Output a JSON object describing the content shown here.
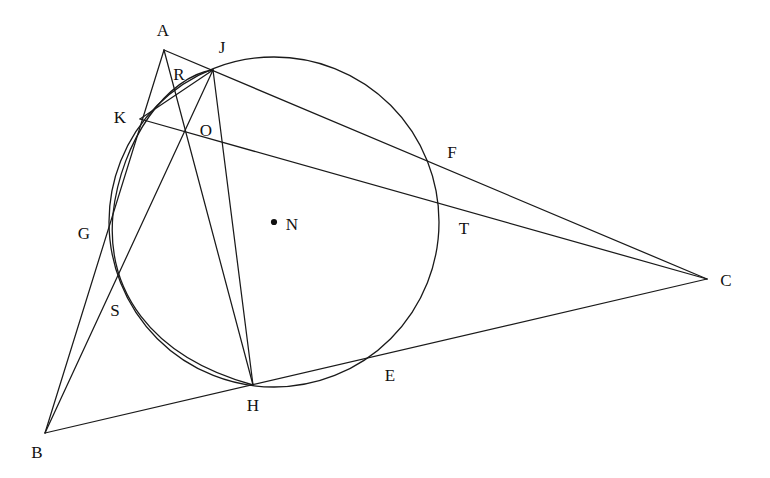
{
  "figure": {
    "type": "euclidean-geometry-diagram",
    "canvas": {
      "width": 770,
      "height": 478
    },
    "stroke_color": "#1a1a1a",
    "background_color": "#ffffff",
    "label_color": "#111111"
  },
  "points": [
    {
      "id": "A",
      "label": "A",
      "x": 164,
      "y": 50,
      "label_x": 163,
      "label_y": 30,
      "marked": false
    },
    {
      "id": "J",
      "label": "J",
      "x": 213,
      "y": 70,
      "label_x": 222,
      "label_y": 47,
      "marked": false
    },
    {
      "id": "R",
      "label": "R",
      "x": 184,
      "y": 92,
      "label_x": 179,
      "label_y": 74,
      "marked": false
    },
    {
      "id": "K",
      "label": "K",
      "x": 140,
      "y": 119,
      "label_x": 120,
      "label_y": 117,
      "marked": false
    },
    {
      "id": "O",
      "label": "O",
      "x": 185,
      "y": 133,
      "label_x": 206,
      "label_y": 130,
      "marked": false
    },
    {
      "id": "F",
      "label": "F",
      "x": 440,
      "y": 152,
      "label_x": 452,
      "label_y": 152,
      "marked": false
    },
    {
      "id": "N",
      "label": "N",
      "x": 274,
      "y": 222,
      "label_x": 292,
      "label_y": 224,
      "marked": true
    },
    {
      "id": "T",
      "label": "T",
      "x": 442,
      "y": 214,
      "label_x": 464,
      "label_y": 228,
      "marked": false
    },
    {
      "id": "G",
      "label": "G",
      "x": 103,
      "y": 235,
      "label_x": 84,
      "label_y": 233,
      "marked": false
    },
    {
      "id": "C",
      "label": "C",
      "x": 707,
      "y": 279,
      "label_x": 726,
      "label_y": 280,
      "marked": false
    },
    {
      "id": "S",
      "label": "S",
      "x": 115,
      "y": 282,
      "label_x": 115,
      "label_y": 310,
      "marked": false
    },
    {
      "id": "E",
      "label": "E",
      "x": 378,
      "y": 356,
      "label_x": 390,
      "label_y": 375,
      "marked": false
    },
    {
      "id": "H",
      "label": "H",
      "x": 253,
      "y": 385,
      "label_x": 253,
      "label_y": 405,
      "marked": false
    },
    {
      "id": "B",
      "label": "B",
      "x": 45,
      "y": 433,
      "label_x": 37,
      "label_y": 452,
      "marked": false
    }
  ],
  "circles": [
    {
      "id": "circumcircle-N",
      "name": "main-circle-centre-N",
      "cx": 274,
      "cy": 222,
      "r": 165
    }
  ],
  "arcs": [
    {
      "id": "arc-J-K-H",
      "name": "secondary-arc-through-J-K-S-H",
      "path": "M 213 70 C 168 76 121 140 113 214 C 106 288 148 356 253 385"
    }
  ],
  "segments": [
    {
      "id": "seg-A-B",
      "name": "side-AB",
      "from": "A",
      "to": "B",
      "x1": 164,
      "y1": 50,
      "x2": 45,
      "y2": 433
    },
    {
      "id": "seg-A-H",
      "name": "cevian-AH",
      "from": "A",
      "to": "H",
      "x1": 164,
      "y1": 50,
      "x2": 253,
      "y2": 385
    },
    {
      "id": "seg-A-C",
      "name": "side-AC-through-J-F",
      "from": "A",
      "to": "C",
      "x1": 164,
      "y1": 50,
      "x2": 707,
      "y2": 279
    },
    {
      "id": "seg-B-C",
      "name": "side-BC-through-H-E",
      "from": "B",
      "to": "C",
      "x1": 45,
      "y1": 433,
      "x2": 707,
      "y2": 279
    },
    {
      "id": "seg-B-J",
      "name": "line-BJ-through-S-O",
      "from": "B",
      "to": "J",
      "x1": 45,
      "y1": 433,
      "x2": 213,
      "y2": 70
    },
    {
      "id": "seg-K-C",
      "name": "line-KC-through-O-T",
      "from": "K",
      "to": "C",
      "x1": 140,
      "y1": 119,
      "x2": 707,
      "y2": 279
    },
    {
      "id": "seg-K-J",
      "name": "chord-KJ",
      "from": "K",
      "to": "J",
      "x1": 140,
      "y1": 119,
      "x2": 213,
      "y2": 70
    },
    {
      "id": "seg-J-H",
      "name": "chord-JH-through-O",
      "from": "J",
      "to": "H",
      "x1": 213,
      "y1": 70,
      "x2": 253,
      "y2": 385
    }
  ]
}
